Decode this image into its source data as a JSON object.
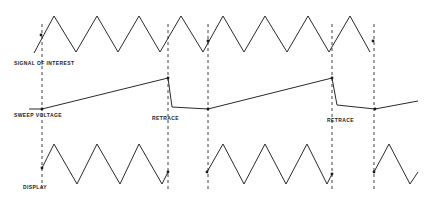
{
  "diagram": {
    "type": "sweep-timing-diagram",
    "labels": {
      "signal": "SIGNAL OF INTEREST",
      "sweep": "SWEEP VOLTAGE",
      "retrace_1": "RETRACE",
      "retrace_2": "RETRACE",
      "display": "DISPLAY"
    },
    "colors": {
      "line": "#2a2a2a",
      "background": "#ffffff"
    },
    "signal_of_interest": {
      "waveform": "triangle",
      "points": [
        [
          34,
          53
        ],
        [
          54,
          16
        ],
        [
          76,
          52
        ],
        [
          97,
          16
        ],
        [
          118,
          52
        ],
        [
          139,
          16
        ],
        [
          160,
          52
        ],
        [
          181,
          16
        ],
        [
          203,
          52
        ],
        [
          223,
          16
        ],
        [
          244,
          52
        ],
        [
          265,
          16
        ],
        [
          287,
          52
        ],
        [
          308,
          16
        ],
        [
          329,
          52
        ],
        [
          350,
          16
        ],
        [
          370,
          52
        ]
      ]
    },
    "sweep_voltage": {
      "segments": [
        [
          [
            29,
            109
          ],
          [
            42,
            109
          ],
          [
            168,
            78
          ],
          [
            172,
            107
          ],
          [
            208,
            109
          ],
          [
            332,
            78
          ],
          [
            337,
            105
          ],
          [
            375,
            109
          ],
          [
            418,
            101
          ]
        ]
      ]
    },
    "display": {
      "segments": [
        [
          [
            42,
            168
          ],
          [
            54,
            144
          ],
          [
            77,
            184
          ],
          [
            97,
            144
          ],
          [
            120,
            184
          ],
          [
            139,
            144
          ],
          [
            162,
            184
          ],
          [
            168,
            172
          ]
        ],
        [
          [
            207,
            172
          ],
          [
            223,
            144
          ],
          [
            244,
            184
          ],
          [
            265,
            144
          ],
          [
            286,
            184
          ],
          [
            307,
            144
          ],
          [
            327,
            184
          ],
          [
            332,
            174
          ]
        ],
        [
          [
            374,
            172
          ],
          [
            389,
            144
          ],
          [
            410,
            184
          ],
          [
            418,
            172
          ]
        ]
      ]
    },
    "sync_lines_x": [
      42,
      168,
      208,
      332,
      374
    ],
    "markers": [
      [
        41,
        35
      ],
      [
        208,
        41
      ],
      [
        373,
        41
      ],
      [
        42,
        109
      ],
      [
        168,
        78
      ],
      [
        208,
        109
      ],
      [
        332,
        78
      ],
      [
        375,
        109
      ],
      [
        42,
        168
      ],
      [
        168,
        172
      ],
      [
        207,
        172
      ],
      [
        332,
        174
      ],
      [
        374,
        172
      ]
    ]
  }
}
